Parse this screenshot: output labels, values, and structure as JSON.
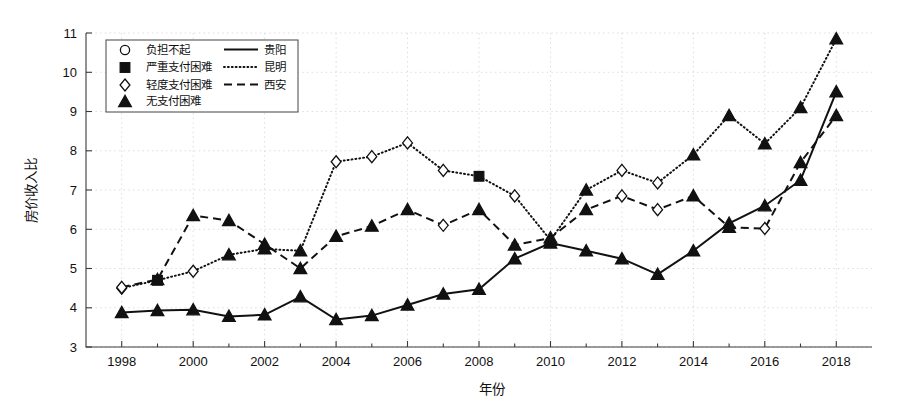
{
  "chart_data": {
    "type": "line",
    "title": "",
    "xlabel": "年份",
    "ylabel": "房价收入比",
    "xlim": [
      1997,
      2019
    ],
    "ylim": [
      3,
      11
    ],
    "grid": true,
    "legend_position": "top-left inside axes",
    "x": [
      1998,
      1999,
      2000,
      2001,
      2002,
      2003,
      2004,
      2005,
      2006,
      2007,
      2008,
      2009,
      2010,
      2011,
      2012,
      2013,
      2014,
      2015,
      2016,
      2017,
      2018
    ],
    "xtick_labels": [
      "1998",
      "2000",
      "2002",
      "2004",
      "2006",
      "2008",
      "2010",
      "2012",
      "2014",
      "2016",
      "2018"
    ],
    "xtick_values": [
      1998,
      2000,
      2002,
      2004,
      2006,
      2008,
      2010,
      2012,
      2014,
      2016,
      2018
    ],
    "ytick_labels": [
      "3",
      "4",
      "5",
      "6",
      "7",
      "8",
      "9",
      "10",
      "11"
    ],
    "ytick_values": [
      3,
      4,
      5,
      6,
      7,
      8,
      9,
      10,
      11
    ],
    "series": [
      {
        "name": "贵阳",
        "style": "solid",
        "values": [
          3.88,
          3.93,
          3.95,
          3.78,
          3.82,
          4.28,
          3.7,
          3.8,
          4.07,
          4.35,
          4.47,
          5.25,
          5.65,
          5.45,
          5.25,
          4.85,
          5.45,
          6.15,
          6.6,
          7.25,
          9.5
        ],
        "markers": [
          "triangle",
          "triangle",
          "triangle",
          "triangle",
          "triangle",
          "triangle",
          "triangle",
          "triangle",
          "triangle",
          "triangle",
          "triangle",
          "triangle",
          "triangle",
          "triangle",
          "triangle",
          "triangle",
          "triangle",
          "triangle",
          "triangle",
          "triangle",
          "triangle"
        ]
      },
      {
        "name": "昆明",
        "style": "dotted",
        "values": [
          4.5,
          4.7,
          4.93,
          5.35,
          5.5,
          5.45,
          7.72,
          7.85,
          8.2,
          7.5,
          7.35,
          6.85,
          5.72,
          7.0,
          7.5,
          7.18,
          7.9,
          8.9,
          8.18,
          9.1,
          10.85
        ],
        "markers": [
          "diamond",
          "square",
          "diamond",
          "triangle",
          "triangle",
          "triangle",
          "diamond",
          "diamond",
          "diamond",
          "diamond",
          "square",
          "diamond",
          "triangle",
          "triangle",
          "diamond",
          "diamond",
          "triangle",
          "triangle",
          "triangle",
          "triangle",
          "triangle"
        ]
      },
      {
        "name": "西安",
        "style": "dashed",
        "values": [
          4.52,
          4.72,
          6.35,
          6.22,
          5.62,
          5.0,
          5.82,
          6.08,
          6.5,
          6.1,
          6.5,
          5.6,
          5.78,
          6.5,
          6.85,
          6.5,
          6.85,
          6.05,
          6.02,
          7.7,
          8.9
        ],
        "markers": [
          "diamond",
          "triangle",
          "triangle",
          "triangle",
          "triangle",
          "triangle",
          "triangle",
          "triangle",
          "triangle",
          "diamond",
          "triangle",
          "triangle",
          "triangle",
          "triangle",
          "diamond",
          "diamond",
          "triangle",
          "triangle",
          "diamond",
          "triangle",
          "triangle"
        ]
      }
    ],
    "marker_legend": [
      {
        "marker": "circle",
        "label": "负担不起"
      },
      {
        "marker": "square",
        "label": "严重支付困难"
      },
      {
        "marker": "diamond",
        "label": "轻度支付困难"
      },
      {
        "marker": "triangle",
        "label": "无支付困难"
      }
    ],
    "line_legend": [
      {
        "style": "solid",
        "label": "贵阳"
      },
      {
        "style": "dotted",
        "label": "昆明"
      },
      {
        "style": "dashed",
        "label": "西安"
      }
    ],
    "colors": {
      "series": "#111111",
      "grid": "#cfcfcf",
      "axis": "#3a3a3a",
      "background": "#ffffff"
    }
  },
  "axes": {
    "ylabel": "房价收入比",
    "xlabel": "年份"
  }
}
